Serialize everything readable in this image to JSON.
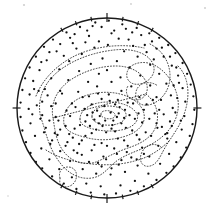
{
  "figure": {
    "title": "Stereographic pole figure with point density contours",
    "type": "pole-figure",
    "background_color": "#ffffff",
    "ink_color": "#1a1a1a",
    "contour_color": "#2b2b2b",
    "point_color": "#111111"
  },
  "projection": {
    "shape": "circle",
    "center_x": 107,
    "center_y": 108,
    "radius": 90,
    "outline_width": 1.4,
    "outline_color": "#1a1a1a"
  },
  "ticks": {
    "label": "perimeter-graduations",
    "major": [
      {
        "name": "tick-north",
        "angle_deg": 90,
        "length": 9
      },
      {
        "name": "tick-south",
        "angle_deg": 270,
        "length": 9
      },
      {
        "name": "tick-west",
        "angle_deg": 180,
        "length": 8
      },
      {
        "name": "tick-east",
        "angle_deg": 0,
        "length": 8
      }
    ],
    "minor_angles_deg": [
      60,
      70,
      80,
      100,
      110,
      120,
      240,
      250,
      260,
      280,
      290,
      300
    ],
    "minor_length": 4.5
  },
  "chart_data": {
    "type": "scatter",
    "title": "Stereographic pole figure with point density contours",
    "xlabel": "",
    "ylabel": "",
    "xlim": [
      -1,
      1
    ],
    "ylim": [
      -1,
      1
    ],
    "grid": false,
    "legend": "none",
    "point_count": 268,
    "point_radius_px": 1.15,
    "note": "Normalized unit-disc coordinates; y positive upward.",
    "points": [
      [
        0.02,
        0.97
      ],
      [
        -0.13,
        0.95
      ],
      [
        0.17,
        0.93
      ],
      [
        -0.3,
        0.9
      ],
      [
        0.33,
        0.89
      ],
      [
        -0.45,
        0.84
      ],
      [
        0.47,
        0.83
      ],
      [
        0.58,
        0.78
      ],
      [
        -0.6,
        0.76
      ],
      [
        0.68,
        0.7
      ],
      [
        -0.7,
        0.68
      ],
      [
        0.76,
        0.61
      ],
      [
        -0.79,
        0.57
      ],
      [
        0.84,
        0.5
      ],
      [
        -0.86,
        0.45
      ],
      [
        0.89,
        0.38
      ],
      [
        -0.91,
        0.33
      ],
      [
        0.93,
        0.26
      ],
      [
        -0.94,
        0.2
      ],
      [
        0.96,
        0.13
      ],
      [
        -0.96,
        0.06
      ],
      [
        0.97,
        -0.02
      ],
      [
        -0.96,
        -0.1
      ],
      [
        0.95,
        -0.18
      ],
      [
        -0.94,
        -0.25
      ],
      [
        0.92,
        -0.31
      ],
      [
        -0.9,
        -0.38
      ],
      [
        0.88,
        -0.44
      ],
      [
        -0.85,
        -0.5
      ],
      [
        0.82,
        -0.55
      ],
      [
        -0.79,
        -0.6
      ],
      [
        0.74,
        -0.65
      ],
      [
        -0.72,
        -0.67
      ],
      [
        0.66,
        -0.72
      ],
      [
        -0.61,
        -0.76
      ],
      [
        0.55,
        -0.8
      ],
      [
        -0.48,
        -0.84
      ],
      [
        0.41,
        -0.87
      ],
      [
        -0.34,
        -0.9
      ],
      [
        0.26,
        -0.92
      ],
      [
        -0.18,
        -0.94
      ],
      [
        0.1,
        -0.95
      ],
      [
        -0.03,
        -0.96
      ],
      [
        0.05,
        0.83
      ],
      [
        -0.2,
        0.8
      ],
      [
        0.24,
        0.76
      ],
      [
        -0.38,
        0.72
      ],
      [
        0.42,
        0.7
      ],
      [
        0.55,
        0.66
      ],
      [
        -0.56,
        0.63
      ],
      [
        0.63,
        0.57
      ],
      [
        -0.67,
        0.53
      ],
      [
        0.72,
        0.47
      ],
      [
        -0.75,
        0.42
      ],
      [
        0.79,
        0.36
      ],
      [
        -0.82,
        0.3
      ],
      [
        0.84,
        0.22
      ],
      [
        -0.86,
        0.15
      ],
      [
        0.87,
        0.07
      ],
      [
        -0.87,
        -0.01
      ],
      [
        0.86,
        -0.09
      ],
      [
        -0.85,
        -0.17
      ],
      [
        0.83,
        -0.24
      ],
      [
        -0.8,
        -0.31
      ],
      [
        0.77,
        -0.38
      ],
      [
        -0.73,
        -0.45
      ],
      [
        0.69,
        -0.51
      ],
      [
        -0.64,
        -0.57
      ],
      [
        0.59,
        -0.62
      ],
      [
        -0.53,
        -0.68
      ],
      [
        0.46,
        -0.73
      ],
      [
        -0.39,
        -0.77
      ],
      [
        0.31,
        -0.81
      ],
      [
        -0.23,
        -0.84
      ],
      [
        0.15,
        -0.86
      ],
      [
        -0.07,
        -0.87
      ],
      [
        0.01,
        0.7
      ],
      [
        -0.14,
        0.67
      ],
      [
        0.19,
        0.63
      ],
      [
        -0.28,
        0.6
      ],
      [
        0.34,
        0.57
      ],
      [
        -0.42,
        0.52
      ],
      [
        0.48,
        0.48
      ],
      [
        -0.53,
        0.43
      ],
      [
        0.58,
        0.38
      ],
      [
        -0.62,
        0.33
      ],
      [
        0.66,
        0.27
      ],
      [
        -0.69,
        0.21
      ],
      [
        0.71,
        0.14
      ],
      [
        -0.72,
        0.07
      ],
      [
        0.73,
        0.0
      ],
      [
        -0.72,
        -0.08
      ],
      [
        0.7,
        -0.15
      ],
      [
        -0.68,
        -0.22
      ],
      [
        0.65,
        -0.29
      ],
      [
        -0.61,
        -0.36
      ],
      [
        0.57,
        -0.42
      ],
      [
        -0.52,
        -0.48
      ],
      [
        0.47,
        -0.54
      ],
      [
        -0.41,
        -0.59
      ],
      [
        0.34,
        -0.64
      ],
      [
        -0.27,
        -0.68
      ],
      [
        0.2,
        -0.71
      ],
      [
        -0.12,
        -0.73
      ],
      [
        0.04,
        -0.74
      ],
      [
        -0.05,
        0.55
      ],
      [
        0.11,
        0.52
      ],
      [
        -0.18,
        0.49
      ],
      [
        0.25,
        0.45
      ],
      [
        -0.31,
        0.41
      ],
      [
        0.37,
        0.36
      ],
      [
        -0.43,
        0.31
      ],
      [
        0.48,
        0.25
      ],
      [
        -0.52,
        0.19
      ],
      [
        0.55,
        0.12
      ],
      [
        -0.57,
        0.05
      ],
      [
        0.58,
        -0.02
      ],
      [
        -0.57,
        -0.1
      ],
      [
        0.55,
        -0.17
      ],
      [
        -0.52,
        -0.24
      ],
      [
        0.49,
        -0.31
      ],
      [
        -0.44,
        -0.38
      ],
      [
        0.39,
        -0.44
      ],
      [
        -0.33,
        -0.5
      ],
      [
        0.27,
        -0.55
      ],
      [
        -0.2,
        -0.6
      ],
      [
        0.13,
        -0.63
      ],
      [
        -0.06,
        -0.65
      ],
      [
        0.0,
        0.42
      ],
      [
        -0.09,
        0.38
      ],
      [
        0.15,
        0.34
      ],
      [
        -0.21,
        0.29
      ],
      [
        0.27,
        0.24
      ],
      [
        -0.32,
        0.18
      ],
      [
        0.36,
        0.12
      ],
      [
        -0.39,
        0.05
      ],
      [
        0.41,
        -0.02
      ],
      [
        -0.41,
        -0.09
      ],
      [
        0.39,
        -0.16
      ],
      [
        -0.36,
        -0.23
      ],
      [
        0.33,
        -0.3
      ],
      [
        -0.28,
        -0.36
      ],
      [
        0.23,
        -0.42
      ],
      [
        -0.17,
        -0.47
      ],
      [
        0.11,
        -0.51
      ],
      [
        -0.04,
        -0.54
      ],
      [
        0.05,
        0.29
      ],
      [
        -0.11,
        0.24
      ],
      [
        0.16,
        0.19
      ],
      [
        -0.2,
        0.13
      ],
      [
        0.23,
        0.06
      ],
      [
        -0.25,
        -0.01
      ],
      [
        0.25,
        -0.08
      ],
      [
        -0.24,
        -0.15
      ],
      [
        0.21,
        -0.22
      ],
      [
        -0.17,
        -0.28
      ],
      [
        0.12,
        -0.34
      ],
      [
        -0.06,
        -0.39
      ],
      [
        0.0,
        -0.42
      ],
      [
        0.02,
        0.15
      ],
      [
        -0.06,
        0.1
      ],
      [
        0.09,
        0.04
      ],
      [
        -0.11,
        -0.03
      ],
      [
        0.11,
        -0.1
      ],
      [
        -0.09,
        -0.17
      ],
      [
        0.05,
        -0.23
      ],
      [
        -0.01,
        -0.27
      ],
      [
        0.04,
        -0.05
      ],
      [
        -0.03,
        0.02
      ],
      [
        0.07,
        -0.14
      ],
      [
        -0.08,
        -0.09
      ],
      [
        0.13,
        -0.06
      ],
      [
        -0.14,
        -0.13
      ],
      [
        0.16,
        -0.17
      ],
      [
        -0.16,
        -0.05
      ],
      [
        0.19,
        -0.11
      ],
      [
        -0.19,
        -0.2
      ],
      [
        0.06,
        -0.19
      ],
      [
        -0.02,
        -0.14
      ],
      [
        0.09,
        -0.26
      ],
      [
        -0.12,
        -0.24
      ],
      [
        0.14,
        0.01
      ],
      [
        -0.17,
        0.04
      ],
      [
        0.2,
        -0.02
      ],
      [
        -0.22,
        -0.08
      ],
      [
        0.03,
        0.08
      ],
      [
        -0.05,
        -0.2
      ],
      [
        0.12,
        0.09
      ],
      [
        -0.1,
        0.16
      ],
      [
        0.44,
        0.62
      ],
      [
        -0.48,
        0.58
      ],
      [
        0.52,
        0.54
      ],
      [
        -0.34,
        0.66
      ],
      [
        0.29,
        0.69
      ],
      [
        -0.24,
        0.73
      ],
      [
        0.13,
        0.77
      ],
      [
        -0.09,
        0.74
      ],
      [
        0.38,
        0.81
      ],
      [
        -0.41,
        0.78
      ],
      [
        0.5,
        0.74
      ],
      [
        -0.52,
        0.71
      ],
      [
        0.61,
        0.67
      ],
      [
        -0.64,
        0.62
      ],
      [
        0.7,
        0.57
      ],
      [
        -0.73,
        0.51
      ],
      [
        0.77,
        0.45
      ],
      [
        0.31,
        -0.12
      ],
      [
        -0.3,
        -0.19
      ],
      [
        0.35,
        -0.06
      ],
      [
        -0.35,
        0.01
      ],
      [
        0.29,
        0.05
      ],
      [
        -0.27,
        0.12
      ],
      [
        0.44,
        0.04
      ],
      [
        -0.45,
        -0.03
      ],
      [
        0.47,
        -0.12
      ],
      [
        -0.46,
        -0.2
      ],
      [
        0.43,
        -0.27
      ],
      [
        -0.38,
        -0.33
      ],
      [
        0.51,
        0.09
      ],
      [
        -0.5,
        0.16
      ],
      [
        0.53,
        -0.06
      ],
      [
        -0.54,
        -0.14
      ],
      [
        0.56,
        -0.22
      ],
      [
        -0.55,
        -0.3
      ],
      [
        -0.62,
        0.02
      ],
      [
        0.63,
        -0.07
      ],
      [
        -0.64,
        -0.14
      ],
      [
        0.61,
        -0.21
      ],
      [
        -0.58,
        -0.28
      ],
      [
        0.6,
        0.09
      ],
      [
        -0.66,
        0.14
      ],
      [
        0.67,
        -0.28
      ],
      [
        0.08,
        -0.45
      ],
      [
        -0.14,
        -0.41
      ],
      [
        0.19,
        -0.36
      ],
      [
        -0.24,
        -0.31
      ],
      [
        0.28,
        -0.25
      ],
      [
        -0.31,
        -0.4
      ],
      [
        0.36,
        -0.35
      ],
      [
        -0.42,
        -0.29
      ],
      [
        0.22,
        -0.49
      ],
      [
        -0.28,
        -0.52
      ],
      [
        0.33,
        -0.57
      ],
      [
        -0.37,
        -0.47
      ],
      [
        0.41,
        -0.51
      ],
      [
        -0.46,
        -0.42
      ],
      [
        0.16,
        -0.58
      ],
      [
        -0.1,
        -0.61
      ],
      [
        0.05,
        -0.67
      ],
      [
        -0.01,
        -0.57
      ],
      [
        0.74,
        0.25
      ],
      [
        -0.76,
        0.19
      ],
      [
        0.78,
        0.11
      ],
      [
        -0.78,
        0.03
      ],
      [
        0.76,
        -0.05
      ],
      [
        -0.74,
        -0.12
      ],
      [
        0.72,
        -0.2
      ],
      [
        -0.7,
        -0.27
      ],
      [
        0.67,
        -0.34
      ],
      [
        -0.63,
        -0.4
      ],
      [
        0.8,
        0.28
      ],
      [
        -0.81,
        0.21
      ],
      [
        0.82,
        -0.14
      ],
      [
        -0.83,
        -0.07
      ],
      [
        -0.22,
        0.86
      ],
      [
        0.28,
        0.84
      ],
      [
        -0.36,
        0.82
      ],
      [
        0.21,
        0.88
      ],
      [
        -0.06,
        0.9
      ],
      [
        0.08,
        0.86
      ],
      [
        -0.16,
        0.91
      ]
    ],
    "contours": {
      "description": "Nested density contour lines drawn as fine dotted curves",
      "levels": [
        1,
        2,
        3,
        4,
        5
      ],
      "level_unit": "multiples of uniform density",
      "line_style": "dotted",
      "closed_maximum": {
        "name": "central-density-maximum",
        "center": [
          0.0,
          -0.06
        ],
        "nested_rings": 4
      },
      "secondary_maximum": {
        "name": "lower-left-secondary-maximum",
        "center": [
          -0.52,
          -0.68
        ],
        "nested_rings": 1
      }
    }
  }
}
